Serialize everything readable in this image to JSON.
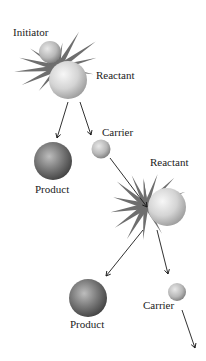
{
  "diagram": {
    "type": "chain-reaction",
    "labels": {
      "initiator": "Initiator",
      "reactant_1": "Reactant",
      "carrier_1": "Carrier",
      "product_1": "Product",
      "reactant_2": "Reactant",
      "product_2": "Product",
      "carrier_2": "Carrier"
    },
    "colors": {
      "sphere_light": "#e6e6e6",
      "sphere_mid": "#b0b0b0",
      "sphere_dark": "#5a5a5a",
      "spike": "#6e6e6e",
      "arrow": "#1a1a1a",
      "text": "#222222"
    }
  }
}
